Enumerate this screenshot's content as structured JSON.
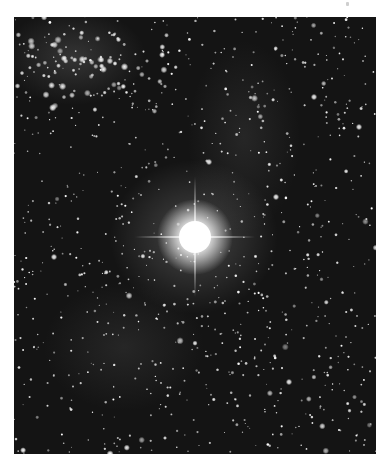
{
  "image": {
    "subject": "star field with bright central star",
    "colors": {
      "background_margin": "#ffffff",
      "sky": "#141414",
      "star": "#ffffff"
    },
    "frame": {
      "left": 14,
      "top": 17,
      "width": 362,
      "height": 437
    },
    "bright_star": {
      "x": 181,
      "y": 220,
      "glow_radius": 38,
      "spike_length": 60
    },
    "cluster": {
      "x": 70,
      "y": 45,
      "spread": 75,
      "count": 90
    },
    "field_star_count": 900,
    "seed": 7
  }
}
